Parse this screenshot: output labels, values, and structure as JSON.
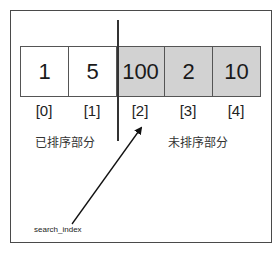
{
  "diagram": {
    "array": {
      "cells": [
        {
          "value": "1",
          "index": "[0]",
          "region": "sorted"
        },
        {
          "value": "5",
          "index": "[1]",
          "region": "sorted"
        },
        {
          "value": "100",
          "index": "[2]",
          "region": "unsorted"
        },
        {
          "value": "2",
          "index": "[3]",
          "region": "unsorted"
        },
        {
          "value": "10",
          "index": "[4]",
          "region": "unsorted"
        }
      ]
    },
    "regions": {
      "sorted_label": "已排序部分",
      "unsorted_label": "未排序部分"
    },
    "pointer": {
      "label": "search_index",
      "points_to_index": 2
    },
    "colors": {
      "sorted_fill": "#ffffff",
      "unsorted_fill": "#d2d2d2",
      "border": "#555555",
      "frame": "#4a4a4a"
    }
  }
}
